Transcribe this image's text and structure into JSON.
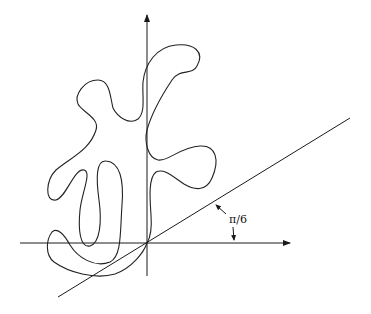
{
  "diagram": {
    "type": "geometric-figure",
    "angle_label": "π/6",
    "colors": {
      "stroke": "#222222",
      "background": "#ffffff"
    },
    "origin": [
      147,
      243
    ],
    "x_axis": {
      "from": [
        20,
        243
      ],
      "to": [
        291,
        243
      ],
      "arrow": true
    },
    "y_axis": {
      "from": [
        147,
        276
      ],
      "to": [
        147,
        14
      ],
      "arrow": true
    },
    "angled_line": {
      "from": [
        58,
        297
      ],
      "to": [
        350,
        118
      ],
      "angle": "π/6"
    }
  }
}
